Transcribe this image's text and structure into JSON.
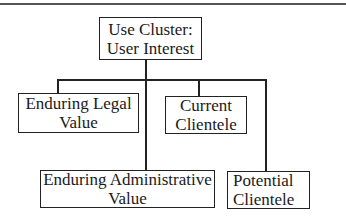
{
  "diagram": {
    "type": "hierarchy",
    "root": {
      "lines": [
        "Use Cluster:",
        "User Interest"
      ]
    },
    "children": [
      {
        "id": "enduring-legal",
        "lines": [
          "Enduring Legal",
          "Value"
        ]
      },
      {
        "id": "current-clientele",
        "lines": [
          "Current",
          "Clientele"
        ]
      },
      {
        "id": "enduring-administrative",
        "lines": [
          "Enduring Administrative",
          "Value"
        ]
      },
      {
        "id": "potential-clientele",
        "lines": [
          "Potential",
          "Clientele"
        ]
      }
    ]
  }
}
